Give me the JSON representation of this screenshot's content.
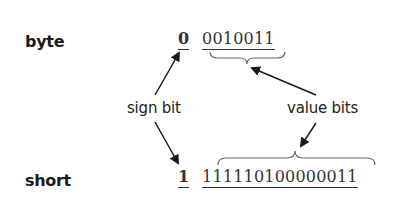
{
  "diagram": {
    "rows": [
      {
        "type_label": "byte",
        "sign_bit": "0",
        "value_bits": "0010011"
      },
      {
        "type_label": "short",
        "sign_bit": "1",
        "value_bits": "111110100000011"
      }
    ],
    "annotations": {
      "sign_bit_label": "sign bit",
      "value_bits_label": "value bits"
    },
    "colors": {
      "text": "#222222",
      "lines": "#333333",
      "braces": "#666666"
    }
  }
}
